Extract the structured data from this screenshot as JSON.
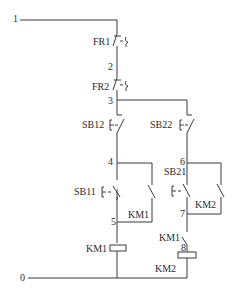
{
  "diagram": {
    "type": "electrical-control-circuit",
    "colors": {
      "line": "#3a3a3a",
      "text": "#2a2a2a",
      "background": "#ffffff"
    },
    "nodes": {
      "n0": "0",
      "n1": "1",
      "n2": "2",
      "n3": "3",
      "n4": "4",
      "n5": "5",
      "n6": "6",
      "n7": "7",
      "n8": "8"
    },
    "components": {
      "fr1": {
        "label": "FR1",
        "kind": "thermal-relay-nc-contact"
      },
      "fr2": {
        "label": "FR2",
        "kind": "thermal-relay-nc-contact"
      },
      "sb12": {
        "label": "SB12",
        "kind": "pushbutton-nc"
      },
      "sb22": {
        "label": "SB22",
        "kind": "pushbutton-nc"
      },
      "sb11": {
        "label": "SB11",
        "kind": "pushbutton-no"
      },
      "sb21": {
        "label": "SB21",
        "kind": "pushbutton-no"
      },
      "km1_aux": {
        "label": "KM1",
        "kind": "contactor-no-auxiliary"
      },
      "km2_aux": {
        "label": "KM2",
        "kind": "contactor-no-auxiliary"
      },
      "km1_interlock": {
        "label": "KM1",
        "kind": "contactor-nc-interlock"
      },
      "km1_coil": {
        "label": "KM1",
        "kind": "coil"
      },
      "km2_coil": {
        "label": "KM2",
        "kind": "coil"
      }
    }
  }
}
